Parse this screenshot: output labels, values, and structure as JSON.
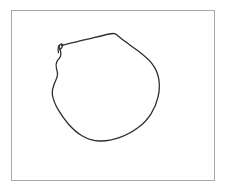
{
  "canvas": {
    "background_color": "#ffffff",
    "width": 226,
    "height": 192
  },
  "frame": {
    "name": "drawing-frame",
    "stroke_color": "#a8a8a8",
    "stroke_width": 1,
    "fill_color": "#ffffff",
    "x": 11,
    "y": 10,
    "width": 203,
    "height": 170
  },
  "sketch": {
    "title": "hand-drawn circle",
    "stroke_color": "#2e2e2e",
    "stroke_width": 1.3,
    "closed": false,
    "description": "Freehand closed loop resembling a slightly polygonal circle with a small hook tail at the upper-left start point.",
    "bounds": {
      "left": 52,
      "top": 33,
      "right": 160,
      "bottom": 141
    },
    "tail_path": "M 58.5 52.5 C 57.6 49.2 58.4 46.2 60.2 44.6 C 61.6 43.4 62.8 44.0 62.6 45.6 C 62.4 47.2 61.3 48.6 59.8 49.6",
    "loop_path": "M 61.4 45.4 C 70.0 43.2 79.0 41.3 87.6 39.2 C 95.0 37.4 102.4 35.4 109.4 34.0 C 112.2 33.4 114.0 33.2 115.4 33.8 C 116.6 34.3 117.4 35.4 118.8 36.6 C 124.8 41.6 131.6 46.0 137.6 50.6 C 143.2 54.9 148.2 58.8 151.8 63.4 C 155.4 68.0 157.8 73.4 158.8 79.2 C 159.8 85.2 159.4 91.4 158.0 97.2 C 156.6 103.2 154.2 108.8 151.0 113.8 C 147.6 119.2 143.2 123.8 138.2 127.6 C 132.8 131.8 126.6 135.0 120.0 137.4 C 113.4 139.8 106.4 141.2 99.6 141.0 C 93.4 140.8 87.6 139.0 82.4 136.0 C 77.2 133.0 72.6 128.8 68.6 124.2 C 64.6 119.6 61.0 114.6 58.0 109.4 C 55.4 104.8 53.2 100.0 52.4 95.0 C 51.8 91.2 52.6 87.8 54.0 84.4 C 55.2 81.4 56.8 78.6 57.4 75.6 C 57.9 73.0 57.0 70.6 56.4 68.2 C 55.8 65.8 55.8 63.6 57.0 61.4 C 58.0 59.6 59.6 58.2 60.4 56.4 C 61.2 54.6 61.0 52.6 60.4 50.6 C 59.9 48.9 59.2 47.2 58.9 45.6",
    "start_point_label": "pen-start",
    "kinks": [
      {
        "x": 57,
        "y": 61
      },
      {
        "x": 57,
        "y": 76
      },
      {
        "x": 53,
        "y": 95
      },
      {
        "x": 115,
        "y": 34
      }
    ]
  }
}
